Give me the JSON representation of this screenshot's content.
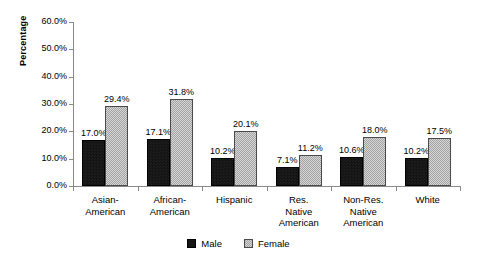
{
  "chart_data": {
    "type": "bar",
    "title": "",
    "subtitle": "",
    "xlabel": "",
    "ylabel": "Percentage",
    "ylim": [
      0,
      60
    ],
    "ytick_labels": [
      "0.0%",
      "10.0%",
      "20.0%",
      "30.0%",
      "40.0%",
      "50.0%",
      "60.0%"
    ],
    "ytick_values": [
      0,
      10,
      20,
      30,
      40,
      50,
      60
    ],
    "grid": false,
    "legend_position": "bottom-center",
    "categories": [
      "Asian-\nAmerican",
      "African-\nAmerican",
      "Hispanic",
      "Res.\nNative\nAmerican",
      "Non-Res.\nNative\nAmerican",
      "White"
    ],
    "series": [
      {
        "name": "Male",
        "color": "#151515",
        "values": [
          17.0,
          17.1,
          10.2,
          7.1,
          10.6,
          10.2
        ],
        "data_labels": [
          "17.0%",
          "17.1%",
          "10.2%",
          "7.1%",
          "10.6%",
          "10.2%"
        ]
      },
      {
        "name": "Female",
        "color": "#a3a3a3",
        "values": [
          29.4,
          31.8,
          20.1,
          11.2,
          18.0,
          17.5
        ],
        "data_labels": [
          "29.4%",
          "31.8%",
          "20.1%",
          "11.2%",
          "18.0%",
          "17.5%"
        ]
      }
    ]
  },
  "legend": {
    "items": [
      {
        "label": "Male",
        "swatch": "male"
      },
      {
        "label": "Female",
        "swatch": "female"
      }
    ]
  }
}
